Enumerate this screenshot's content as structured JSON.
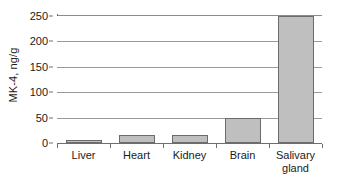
{
  "chart_data": {
    "type": "bar",
    "title": "",
    "xlabel": "",
    "ylabel": "MK-4, ng/g",
    "categories": [
      "Liver",
      "Heart",
      "Kidney",
      "Brain",
      "Salivary\ngland"
    ],
    "values": [
      5,
      15,
      16,
      50,
      250
    ],
    "ylim": [
      0,
      250
    ],
    "yticks": [
      0,
      50,
      100,
      150,
      200,
      250
    ],
    "ytick_labels": [
      "0",
      "50",
      "100",
      "150",
      "200",
      "250"
    ],
    "grid": "horizontal",
    "legend": "none",
    "bar_fill_color": "#bfbfbf",
    "bar_edge_color": "#6b6b6b",
    "axis_color": "#6e6e6e",
    "gridline_color": "#9a9a9a",
    "background_color": "#ffffff",
    "text_color": "#1a1a1a"
  }
}
